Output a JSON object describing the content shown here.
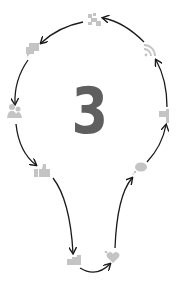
{
  "diagram": {
    "center_label": "3",
    "colors": {
      "icon": "#c4c4c4",
      "arrow": "#1a1a1a",
      "number": "#5f5f5f",
      "background": "#ffffff"
    },
    "nodes": [
      {
        "id": "puzzle",
        "icon": "puzzle-plus-icon",
        "x": 94,
        "y": 20
      },
      {
        "id": "chat",
        "icon": "chat-bubbles-icon",
        "x": 33,
        "y": 49
      },
      {
        "id": "people",
        "icon": "people-icon",
        "x": 14,
        "y": 112
      },
      {
        "id": "thumbs",
        "icon": "thumbs-up-icon",
        "x": 42,
        "y": 172
      },
      {
        "id": "group",
        "icon": "group-handshake-icon",
        "x": 74,
        "y": 261
      },
      {
        "id": "heart",
        "icon": "heart-icon",
        "x": 113,
        "y": 257
      },
      {
        "id": "speech",
        "icon": "speech-bubble-icon",
        "x": 140,
        "y": 168
      },
      {
        "id": "flag",
        "icon": "flag-icon",
        "x": 165,
        "y": 116
      },
      {
        "id": "rss",
        "icon": "rss-icon",
        "x": 150,
        "y": 50
      }
    ],
    "edges": [
      {
        "from": "puzzle",
        "to": "chat"
      },
      {
        "from": "chat",
        "to": "people"
      },
      {
        "from": "people",
        "to": "thumbs"
      },
      {
        "from": "thumbs",
        "to": "group"
      },
      {
        "from": "group",
        "to": "heart"
      },
      {
        "from": "heart",
        "to": "speech"
      },
      {
        "from": "speech",
        "to": "flag"
      },
      {
        "from": "flag",
        "to": "rss"
      },
      {
        "from": "rss",
        "to": "puzzle"
      }
    ]
  }
}
